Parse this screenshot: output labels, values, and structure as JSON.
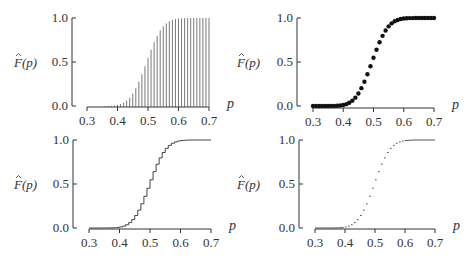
{
  "figure": {
    "ylabel": "F̂(p)",
    "ylabel_base": "F",
    "ylabel_arg": "(p)",
    "xlabel": "p",
    "xticks": [
      "0.3",
      "0.4",
      "0.5",
      "0.6",
      "0.7"
    ],
    "yticks": [
      "0.0",
      "0.5",
      "1.0"
    ]
  },
  "chart_data": [
    {
      "panel": "top-left",
      "type": "bar",
      "style": "vertical needle lines",
      "title": "",
      "xlabel": "p",
      "ylabel": "F̂(p)",
      "xlim": [
        0.3,
        0.7
      ],
      "ylim": [
        0.0,
        1.0
      ],
      "xticks": [
        0.3,
        0.4,
        0.5,
        0.6,
        0.7
      ],
      "yticks": [
        0.0,
        0.5,
        1.0
      ],
      "grid": false,
      "x": [
        0.3,
        0.31,
        0.32,
        0.33,
        0.34,
        0.35,
        0.36,
        0.37,
        0.38,
        0.39,
        0.4,
        0.41,
        0.42,
        0.43,
        0.44,
        0.45,
        0.46,
        0.47,
        0.48,
        0.49,
        0.5,
        0.51,
        0.52,
        0.53,
        0.54,
        0.55,
        0.56,
        0.57,
        0.58,
        0.59,
        0.6,
        0.61,
        0.62,
        0.63,
        0.64,
        0.65,
        0.66,
        0.67,
        0.68,
        0.69,
        0.7
      ],
      "values": [
        0.0,
        0.0,
        0.0,
        0.0,
        0.0,
        0.0,
        0.001,
        0.001,
        0.003,
        0.006,
        0.012,
        0.021,
        0.037,
        0.061,
        0.095,
        0.142,
        0.203,
        0.275,
        0.36,
        0.452,
        0.548,
        0.64,
        0.725,
        0.797,
        0.858,
        0.905,
        0.939,
        0.963,
        0.978,
        0.988,
        0.994,
        0.997,
        0.999,
        0.999,
        1.0,
        1.0,
        1.0,
        1.0,
        1.0,
        1.0,
        1.0
      ]
    },
    {
      "panel": "top-right",
      "type": "scatter",
      "style": "filled dots",
      "title": "",
      "xlabel": "p",
      "ylabel": "F̂(p)",
      "xlim": [
        0.3,
        0.7
      ],
      "ylim": [
        0.0,
        1.0
      ],
      "xticks": [
        0.3,
        0.4,
        0.5,
        0.6,
        0.7
      ],
      "yticks": [
        0.0,
        0.5,
        1.0
      ],
      "grid": false,
      "x": [
        0.3,
        0.31,
        0.32,
        0.33,
        0.34,
        0.35,
        0.36,
        0.37,
        0.38,
        0.39,
        0.4,
        0.41,
        0.42,
        0.43,
        0.44,
        0.45,
        0.46,
        0.47,
        0.48,
        0.49,
        0.5,
        0.51,
        0.52,
        0.53,
        0.54,
        0.55,
        0.56,
        0.57,
        0.58,
        0.59,
        0.6,
        0.61,
        0.62,
        0.63,
        0.64,
        0.65,
        0.66,
        0.67,
        0.68,
        0.69,
        0.7
      ],
      "values": [
        0.0,
        0.0,
        0.0,
        0.0,
        0.0,
        0.0,
        0.001,
        0.001,
        0.003,
        0.006,
        0.012,
        0.021,
        0.037,
        0.061,
        0.095,
        0.142,
        0.203,
        0.275,
        0.36,
        0.452,
        0.548,
        0.64,
        0.725,
        0.797,
        0.858,
        0.905,
        0.939,
        0.963,
        0.978,
        0.988,
        0.994,
        0.997,
        0.999,
        0.999,
        1.0,
        1.0,
        1.0,
        1.0,
        1.0,
        1.0,
        1.0
      ]
    },
    {
      "panel": "bottom-left",
      "type": "line",
      "style": "step function",
      "title": "",
      "xlabel": "p",
      "ylabel": "F̂(p)",
      "xlim": [
        0.3,
        0.7
      ],
      "ylim": [
        0.0,
        1.0
      ],
      "xticks": [
        0.3,
        0.4,
        0.5,
        0.6,
        0.7
      ],
      "yticks": [
        0.0,
        0.5,
        1.0
      ],
      "grid": false,
      "x": [
        0.3,
        0.31,
        0.32,
        0.33,
        0.34,
        0.35,
        0.36,
        0.37,
        0.38,
        0.39,
        0.4,
        0.41,
        0.42,
        0.43,
        0.44,
        0.45,
        0.46,
        0.47,
        0.48,
        0.49,
        0.5,
        0.51,
        0.52,
        0.53,
        0.54,
        0.55,
        0.56,
        0.57,
        0.58,
        0.59,
        0.6,
        0.61,
        0.62,
        0.63,
        0.64,
        0.65,
        0.66,
        0.67,
        0.68,
        0.69,
        0.7
      ],
      "values": [
        0.0,
        0.0,
        0.0,
        0.0,
        0.0,
        0.0,
        0.001,
        0.001,
        0.003,
        0.006,
        0.012,
        0.021,
        0.037,
        0.061,
        0.095,
        0.142,
        0.203,
        0.275,
        0.36,
        0.452,
        0.548,
        0.64,
        0.725,
        0.797,
        0.858,
        0.905,
        0.939,
        0.963,
        0.978,
        0.988,
        0.994,
        0.997,
        0.999,
        0.999,
        1.0,
        1.0,
        1.0,
        1.0,
        1.0,
        1.0,
        1.0
      ]
    },
    {
      "panel": "bottom-right",
      "type": "line",
      "style": "horizontal step segments only (no risers)",
      "title": "",
      "xlabel": "p",
      "ylabel": "F̂(p)",
      "xlim": [
        0.3,
        0.7
      ],
      "ylim": [
        0.0,
        1.0
      ],
      "xticks": [
        0.3,
        0.4,
        0.5,
        0.6,
        0.7
      ],
      "yticks": [
        0.0,
        0.5,
        1.0
      ],
      "grid": false,
      "x": [
        0.3,
        0.31,
        0.32,
        0.33,
        0.34,
        0.35,
        0.36,
        0.37,
        0.38,
        0.39,
        0.4,
        0.41,
        0.42,
        0.43,
        0.44,
        0.45,
        0.46,
        0.47,
        0.48,
        0.49,
        0.5,
        0.51,
        0.52,
        0.53,
        0.54,
        0.55,
        0.56,
        0.57,
        0.58,
        0.59,
        0.6,
        0.61,
        0.62,
        0.63,
        0.64,
        0.65,
        0.66,
        0.67,
        0.68,
        0.69,
        0.7
      ],
      "values": [
        0.0,
        0.0,
        0.0,
        0.0,
        0.0,
        0.0,
        0.001,
        0.001,
        0.003,
        0.006,
        0.012,
        0.021,
        0.037,
        0.061,
        0.095,
        0.142,
        0.203,
        0.275,
        0.36,
        0.452,
        0.548,
        0.64,
        0.725,
        0.797,
        0.858,
        0.905,
        0.939,
        0.963,
        0.978,
        0.988,
        0.994,
        0.997,
        0.999,
        0.999,
        1.0,
        1.0,
        1.0,
        1.0,
        1.0,
        1.0,
        1.0
      ]
    }
  ],
  "panels": [
    {
      "id": "p1",
      "style": "needle",
      "yaxis_x": 72,
      "y1": 18,
      "y0": 106,
      "xaxis_y": 107,
      "x03": 87,
      "x07": 209,
      "xlabel_x": 227,
      "ylabel_x": 14
    },
    {
      "id": "p2",
      "style": "dots",
      "yaxis_x": 297,
      "y1": 18,
      "y0": 106,
      "xaxis_y": 108,
      "x03": 313,
      "x07": 434,
      "xlabel_x": 452,
      "ylabel_x": 237
    },
    {
      "id": "p3",
      "style": "step",
      "yaxis_x": 73,
      "y1": 140,
      "y0": 228,
      "xaxis_y": 229,
      "x03": 89,
      "x07": 211,
      "xlabel_x": 229,
      "ylabel_x": 14
    },
    {
      "id": "p4",
      "style": "hsteps",
      "yaxis_x": 299,
      "y1": 140,
      "y0": 228,
      "xaxis_y": 229,
      "x03": 315,
      "x07": 435,
      "xlabel_x": 453,
      "ylabel_x": 237
    }
  ]
}
